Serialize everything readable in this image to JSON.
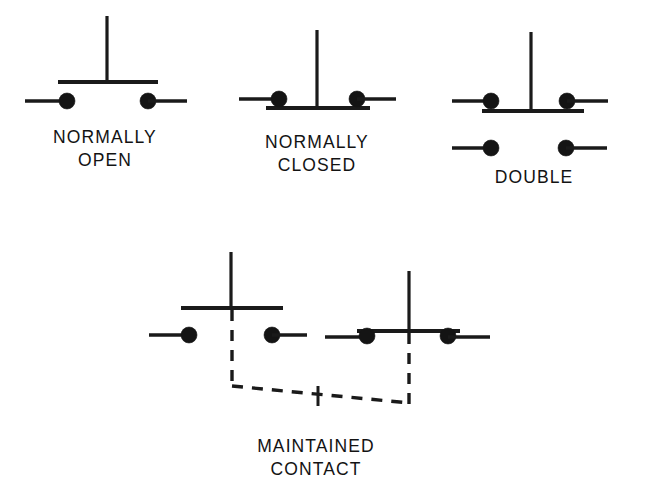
{
  "figure": {
    "background_color": "#ffffff",
    "line_color": "#1a1a1a",
    "symbols": [
      {
        "id": "normally-open",
        "label_line1": "NORMALLY",
        "label_line2": "OPEN",
        "type": "pushbutton-normally-open",
        "poles": 1,
        "contact_state": "open",
        "actuator": "plunger-with-crossbar"
      },
      {
        "id": "normally-closed",
        "label_line1": "NORMALLY",
        "label_line2": "CLOSED",
        "type": "pushbutton-normally-closed",
        "poles": 1,
        "contact_state": "closed",
        "actuator": "plunger-with-crossbar"
      },
      {
        "id": "double",
        "label_line1": "DOUBLE",
        "label_line2": "",
        "type": "pushbutton-double-circuit",
        "poles": 2,
        "contact_state": "upper-closed-lower-open",
        "actuator": "plunger-with-crossbar"
      },
      {
        "id": "maintained-contact",
        "label_line1": "MAINTAINED",
        "label_line2": "CONTACT",
        "type": "pushbutton-maintained-contact",
        "poles": 2,
        "contact_state": "left-open-right-closed",
        "actuator": "mechanically-linked-plungers",
        "link_style": "dashed"
      }
    ]
  }
}
